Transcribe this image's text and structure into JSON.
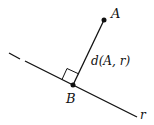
{
  "diagram": {
    "points": {
      "A": {
        "label": "A",
        "x": 104,
        "y": 20
      },
      "B": {
        "label": "B",
        "x": 73,
        "y": 85
      }
    },
    "line": {
      "label": "r"
    },
    "segment_label": "d(A, r)",
    "right_angle_marker": true,
    "colors": {
      "stroke": "#111111",
      "background": "#ffffff"
    }
  }
}
